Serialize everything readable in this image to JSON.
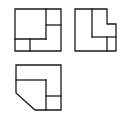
{
  "diagram": {
    "type": "orthographic-three-view",
    "stroke_color": "#1a1a1a",
    "background": "#ffffff",
    "views": [
      {
        "name": "front-view",
        "position": "top-left",
        "outline": [
          [
            15,
            9
          ],
          [
            61,
            9
          ],
          [
            61,
            51
          ],
          [
            15,
            51
          ]
        ],
        "lines": [
          [
            [
              46,
              9
            ],
            [
              46,
              39
            ]
          ],
          [
            [
              46,
              25
            ],
            [
              61,
              25
            ]
          ],
          [
            [
              15,
              39
            ],
            [
              46,
              39
            ]
          ],
          [
            [
              30,
              39
            ],
            [
              30,
              51
            ]
          ]
        ]
      },
      {
        "name": "side-view",
        "position": "top-right",
        "outline": [
          [
            75,
            9
          ],
          [
            107,
            9
          ],
          [
            107,
            24
          ],
          [
            116,
            24
          ],
          [
            116,
            51
          ],
          [
            75,
            51
          ]
        ],
        "lines": [
          [
            [
              92,
              9
            ],
            [
              92,
              37
            ]
          ],
          [
            [
              92,
              37
            ],
            [
              116,
              37
            ]
          ],
          [
            [
              107,
              37
            ],
            [
              107,
              51
            ]
          ]
        ]
      },
      {
        "name": "top-view",
        "position": "bottom-left",
        "outline": [
          [
            16,
            65
          ],
          [
            61,
            65
          ],
          [
            61,
            110
          ],
          [
            35,
            110
          ],
          [
            16,
            93
          ]
        ],
        "lines": [
          [
            [
              16,
              80
            ],
            [
              46,
              80
            ]
          ],
          [
            [
              46,
              80
            ],
            [
              46,
              110
            ]
          ],
          [
            [
              46,
              96
            ],
            [
              61,
              96
            ]
          ]
        ]
      }
    ]
  }
}
